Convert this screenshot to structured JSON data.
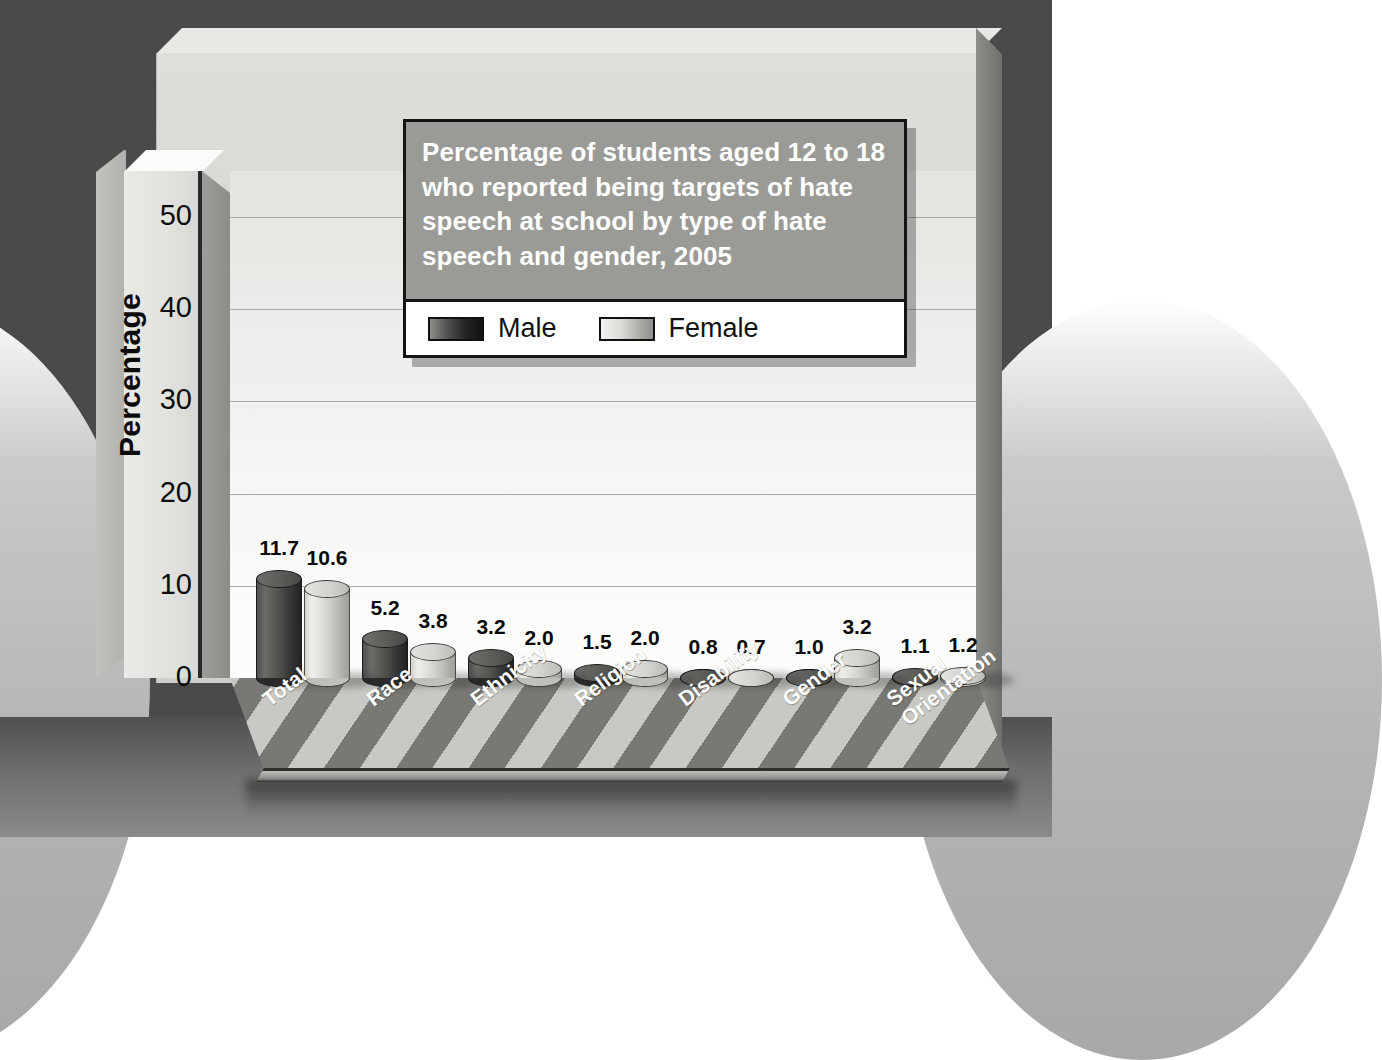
{
  "title": {
    "text": "Percentage of students aged 12 to 18 who reported being targets of hate speech at school by type of hate speech and gender, 2005"
  },
  "legend": {
    "items": [
      {
        "label": "Male",
        "color": "#232322"
      },
      {
        "label": "Female",
        "color": "#dcdcd8"
      }
    ]
  },
  "axes": {
    "ylabel": "Percentage",
    "yticks": [
      "0",
      "10",
      "20",
      "30",
      "40",
      "50"
    ]
  },
  "chart_data": {
    "type": "bar",
    "title": "Percentage of students aged 12 to 18 who reported being targets of hate speech at school by type of hate speech and gender, 2005",
    "xlabel": "",
    "ylabel": "Percentage",
    "ylim": [
      0,
      55
    ],
    "yticks": [
      0,
      10,
      20,
      30,
      40,
      50
    ],
    "grid": true,
    "legend_position": "top-right-inset",
    "categories": [
      "Total",
      "Race",
      "Ethnicity",
      "Religion",
      "Disability",
      "Gender",
      "Sexual Orientation"
    ],
    "series": [
      {
        "name": "Male",
        "color": "#232322",
        "values": [
          11.7,
          5.2,
          3.2,
          1.5,
          0.8,
          1.0,
          1.1
        ]
      },
      {
        "name": "Female",
        "color": "#dcdcd8",
        "values": [
          10.6,
          3.8,
          2.0,
          2.0,
          0.7,
          3.2,
          1.2
        ]
      }
    ],
    "value_labels": [
      [
        "11.7",
        "10.6"
      ],
      [
        "5.2",
        "3.8"
      ],
      [
        "3.2",
        "2.0"
      ],
      [
        "1.5",
        "2.0"
      ],
      [
        "0.8",
        "0.7"
      ],
      [
        "1.0",
        "3.2"
      ],
      [
        "1.1",
        "1.2"
      ]
    ]
  }
}
